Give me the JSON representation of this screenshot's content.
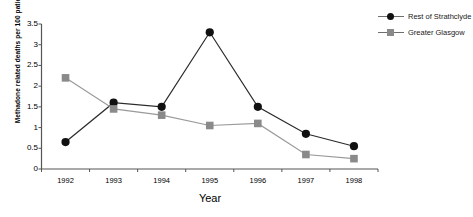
{
  "chart_data": {
    "type": "line",
    "title": "",
    "xlabel": "Year",
    "ylabel": "Methadone related deaths per 100 patients",
    "categories": [
      "1992",
      "1993",
      "1994",
      "1995",
      "1996",
      "1997",
      "1998"
    ],
    "ylim": [
      0,
      3.5
    ],
    "yticks": [
      "0",
      "0.5",
      "1",
      "1.5",
      "2",
      "2.5",
      "3",
      "3.5"
    ],
    "ytick_values": [
      0,
      0.5,
      1,
      1.5,
      2,
      2.5,
      3,
      3.5
    ],
    "grid": false,
    "legend_position": "right",
    "series": [
      {
        "name": "Rest of Strathclyde",
        "marker": "circle",
        "color": "#111111",
        "line_color": "#2b2b2b",
        "values": [
          0.65,
          1.6,
          1.5,
          3.3,
          1.5,
          0.85,
          0.55
        ]
      },
      {
        "name": "Greater Glasgow",
        "marker": "square",
        "color": "#8a8a8a",
        "line_color": "#9a9a9a",
        "values": [
          2.2,
          1.45,
          1.3,
          1.05,
          1.1,
          0.35,
          0.25
        ]
      }
    ]
  },
  "legend": {
    "items": [
      {
        "label": "Rest of Strathclyde",
        "marker": "circle"
      },
      {
        "label": "Greater Glasgow",
        "marker": "square"
      }
    ]
  },
  "axes": {
    "x_title": "Year",
    "y_title": "Methadone related deaths per 100 patients"
  }
}
